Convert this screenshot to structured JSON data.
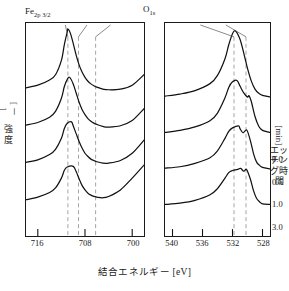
{
  "figure": {
    "xaxis_caption": "結合エネルギー [eV]",
    "ylabel_left_line1": "強",
    "ylabel_left_line2": "度",
    "ylabel_left_unit": "[ － ]",
    "ylabel_right_text": "エッチング時間",
    "ylabel_right_unit": "[min]"
  },
  "panels": [
    {
      "id": "fe",
      "title_main": "Fe",
      "title_sub": "2p 3/2",
      "x_ticks": [
        "716",
        "708",
        "700"
      ],
      "x_range": [
        718,
        698
      ],
      "peak_labels": [
        {
          "text": "Fe",
          "sup": "3+",
          "x": 60,
          "y": 27,
          "leader_x": 86,
          "leader_y0": 36,
          "leader_x1": 90,
          "leader_y1": 48
        },
        {
          "text": "Fe",
          "sup": "2+",
          "x": 85,
          "y": 27,
          "leader_x": 106,
          "leader_y0": 36,
          "leader_x1": 101,
          "leader_y1": 48
        },
        {
          "text": "Fe",
          "sup": "0",
          "x": 112,
          "y": 27,
          "leader_x": 128,
          "leader_y0": 36,
          "leader_x1": 119,
          "leader_y1": 48
        }
      ],
      "guides": [
        {
          "name": "fe3-guide",
          "x": 65
        },
        {
          "name": "fe2-guide",
          "x": 76
        },
        {
          "name": "fe0-guide",
          "x": 94
        }
      ]
    },
    {
      "id": "o",
      "title_main": "O",
      "title_sub": "1s",
      "x_ticks": [
        "540",
        "536",
        "532",
        "528"
      ],
      "x_range": [
        541,
        527
      ],
      "peak_labels": [
        {
          "text": "OH",
          "sup": "",
          "x": 196,
          "y": 27,
          "leader_x": 207,
          "leader_y0": 36,
          "leader_x1": 212,
          "leader_y1": 48
        },
        {
          "text": "OM",
          "sup": "",
          "x": 222,
          "y": 27,
          "leader_x": 230,
          "leader_y0": 36,
          "leader_x1": 224,
          "leader_y1": 48
        }
      ],
      "guides": [
        {
          "name": "oh-guide",
          "x": 48
        },
        {
          "name": "om-guide",
          "x": 60
        }
      ]
    }
  ],
  "etching_times": [
    {
      "value": "0.0",
      "y": 154
    },
    {
      "value": "0.5",
      "y": 177
    },
    {
      "value": "1.0",
      "y": 199
    },
    {
      "value": "3.0",
      "y": 222
    }
  ],
  "chart_data": {
    "type": "line",
    "xlabel": "結合エネルギー [eV]",
    "ylabel": "強度 [－]",
    "legend_label": "エッチング時間 [min]",
    "grid": false,
    "stacked_offset": true,
    "panels": [
      {
        "name": "Fe 2p 3/2",
        "xlim": [
          718,
          698
        ],
        "xticks": [
          716,
          708,
          700
        ],
        "annotations": [
          {
            "label": "Fe3+",
            "binding_energy": 710.9
          },
          {
            "label": "Fe2+",
            "binding_energy": 709.1
          },
          {
            "label": "Fe0",
            "binding_energy": 706.2
          }
        ],
        "series": [
          {
            "name": "0.0",
            "peak_be": 710.9,
            "peak_height": 1.0,
            "baseline": 0.0,
            "x": [
              718,
              716,
              714,
              713,
              712,
              711.5,
              711,
              710.9,
              710.5,
              710,
              709.5,
              709,
              708.5,
              708,
              707.5,
              707,
              706.5,
              706,
              705,
              704,
              702,
              700,
              698
            ],
            "y": [
              0.1,
              0.14,
              0.22,
              0.3,
              0.52,
              0.76,
              0.96,
              1.0,
              0.94,
              0.78,
              0.6,
              0.45,
              0.34,
              0.26,
              0.2,
              0.16,
              0.13,
              0.11,
              0.08,
              0.07,
              0.08,
              0.14,
              0.3
            ]
          },
          {
            "name": "0.5",
            "peak_be": 710.6,
            "peak_height": 0.82,
            "baseline": 0.0,
            "x": [
              718,
              716,
              714,
              713,
              712,
              711.5,
              711,
              710.6,
              710,
              709.5,
              709,
              708.5,
              708,
              707.5,
              707,
              706.5,
              706,
              705,
              704,
              702,
              700,
              698
            ],
            "y": [
              0.09,
              0.13,
              0.21,
              0.3,
              0.5,
              0.68,
              0.79,
              0.82,
              0.72,
              0.58,
              0.44,
              0.33,
              0.25,
              0.19,
              0.15,
              0.12,
              0.1,
              0.07,
              0.06,
              0.08,
              0.16,
              0.34
            ]
          },
          {
            "name": "1.0",
            "peak_be": 710.3,
            "peak_height": 0.7,
            "baseline": 0.0,
            "x": [
              718,
              716,
              714,
              713,
              712,
              711.5,
              711,
              710.3,
              710,
              709.5,
              709,
              708.5,
              708,
              707.5,
              707,
              706.5,
              706,
              705,
              704,
              702,
              700,
              698
            ],
            "y": [
              0.08,
              0.12,
              0.2,
              0.28,
              0.45,
              0.6,
              0.68,
              0.7,
              0.64,
              0.52,
              0.4,
              0.3,
              0.22,
              0.17,
              0.13,
              0.11,
              0.09,
              0.07,
              0.07,
              0.11,
              0.22,
              0.42
            ]
          },
          {
            "name": "3.0",
            "peak_be": 710.0,
            "peak_height": 0.58,
            "baseline": 0.0,
            "x": [
              718,
              716,
              714,
              713,
              712,
              711.5,
              711,
              710,
              709.5,
              709,
              708.5,
              708,
              707.5,
              707,
              706.5,
              706,
              705,
              704,
              702,
              700,
              698
            ],
            "y": [
              0.07,
              0.11,
              0.18,
              0.25,
              0.4,
              0.52,
              0.57,
              0.58,
              0.5,
              0.39,
              0.29,
              0.22,
              0.17,
              0.14,
              0.12,
              0.11,
              0.1,
              0.12,
              0.22,
              0.4,
              0.6
            ]
          }
        ]
      },
      {
        "name": "O 1s",
        "xlim": [
          541,
          527
        ],
        "xticks": [
          540,
          536,
          532,
          528
        ],
        "annotations": [
          {
            "label": "OH",
            "binding_energy": 531.8
          },
          {
            "label": "OM",
            "binding_energy": 530.2
          }
        ],
        "series": [
          {
            "name": "0.0",
            "peak_be": 531.6,
            "peak_height": 1.0,
            "baseline": 0.0,
            "x": [
              541,
              539,
              537,
              535,
              534,
              533,
              532.5,
              532,
              531.6,
              531,
              530.5,
              530,
              529.5,
              529,
              528.5,
              528,
              527
            ],
            "y": [
              0.06,
              0.09,
              0.14,
              0.24,
              0.36,
              0.6,
              0.8,
              0.96,
              1.0,
              0.88,
              0.68,
              0.46,
              0.28,
              0.16,
              0.1,
              0.07,
              0.05
            ]
          },
          {
            "name": "0.5",
            "peak_be": 531.4,
            "peak_height": 0.8,
            "baseline": 0.0,
            "x": [
              541,
              539,
              537,
              535,
              534,
              533,
              532.5,
              532,
              531.4,
              531,
              530.5,
              530,
              529.8,
              529.5,
              529,
              528.5,
              528,
              527
            ],
            "y": [
              0.05,
              0.08,
              0.13,
              0.22,
              0.33,
              0.55,
              0.7,
              0.78,
              0.8,
              0.72,
              0.62,
              0.56,
              0.58,
              0.5,
              0.28,
              0.14,
              0.08,
              0.05
            ]
          },
          {
            "name": "1.0",
            "peak_be": 531.2,
            "peak_height": 0.66,
            "baseline": 0.0,
            "x": [
              541,
              539,
              537,
              535,
              534,
              533,
              532.5,
              532,
              531.2,
              531,
              530.6,
              530.2,
              530,
              529.6,
              529.2,
              528.8,
              528.4,
              528,
              527
            ],
            "y": [
              0.05,
              0.07,
              0.12,
              0.2,
              0.3,
              0.48,
              0.58,
              0.63,
              0.66,
              0.62,
              0.56,
              0.6,
              0.58,
              0.44,
              0.26,
              0.14,
              0.09,
              0.06,
              0.04
            ]
          },
          {
            "name": "3.0",
            "peak_be": 530.9,
            "peak_height": 0.56,
            "baseline": 0.0,
            "x": [
              541,
              539,
              537,
              535,
              534,
              533,
              532.5,
              532,
              531.2,
              530.9,
              530.5,
              530.2,
              530,
              529.6,
              529.2,
              528.8,
              528.4,
              528,
              527
            ],
            "y": [
              0.04,
              0.06,
              0.1,
              0.18,
              0.27,
              0.42,
              0.5,
              0.53,
              0.55,
              0.56,
              0.52,
              0.55,
              0.52,
              0.4,
              0.24,
              0.13,
              0.08,
              0.05,
              0.04
            ]
          }
        ]
      }
    ]
  }
}
